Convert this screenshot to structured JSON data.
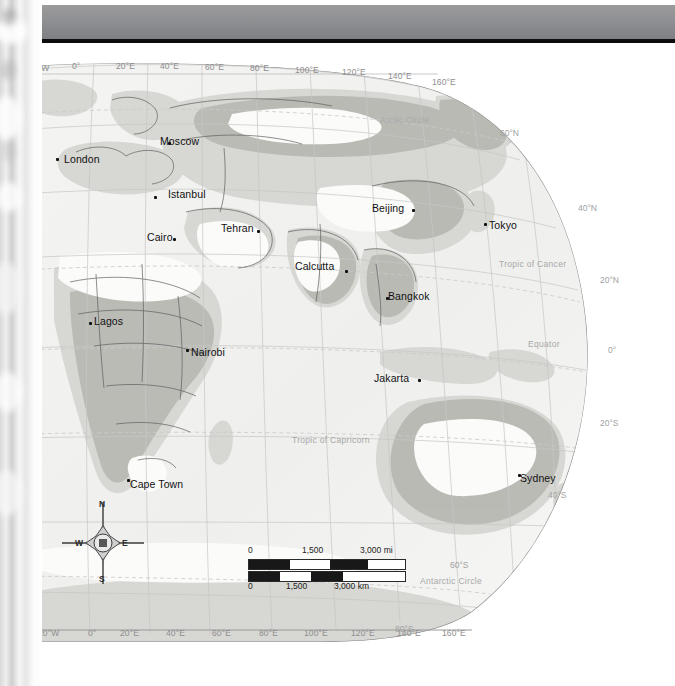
{
  "page": {
    "kind": "atlas-map-plate",
    "projection_note": "Eastern Hemisphere world map",
    "paper_color": "#f2f2f0",
    "header_band_color": "#8f9093",
    "ocean_color": "#ececeb",
    "land_color": "#d9d9d6",
    "land_dark_color": "#b8b8b4",
    "land_light_color": "#fbfbfa",
    "border_color": "#4a4a4a",
    "graticule_color": "#bdbdbd"
  },
  "graticule": {
    "top_longitude_labels": [
      "20°W",
      "0°",
      "20°E",
      "40°E",
      "60°E",
      "80°E",
      "100°E",
      "120°E",
      "140°E",
      "160°E"
    ],
    "bottom_longitude_labels": [
      "W",
      "20°W",
      "0°",
      "20°E",
      "40°E",
      "60°E",
      "80°E",
      "100°E",
      "120°E",
      "140°E",
      "160°E"
    ],
    "latitude_labels": [
      "60°N",
      "40°N",
      "20°N",
      "0°",
      "20°S",
      "40°S",
      "60°S",
      "80°S"
    ]
  },
  "reference_lines": [
    {
      "name": "Arctic Circle"
    },
    {
      "name": "Tropic of Cancer"
    },
    {
      "name": "Equator"
    },
    {
      "name": "Tropic of Capricorn"
    },
    {
      "name": "Antarctic Circle"
    }
  ],
  "cities": [
    {
      "name": "London",
      "x": 36,
      "y": 106,
      "dx": 8,
      "dy": 1
    },
    {
      "name": "Moscow",
      "x": 148,
      "y": 90,
      "dx": -8,
      "dy": -1
    },
    {
      "name": "Istanbul",
      "x": 134,
      "y": 144,
      "dx": 14,
      "dy": -2
    },
    {
      "name": "Cairo",
      "x": 153,
      "y": 186,
      "dx": -26,
      "dy": -1
    },
    {
      "name": "Tehran",
      "x": 237,
      "y": 178,
      "dx": -36,
      "dy": -2
    },
    {
      "name": "Beijing",
      "x": 392,
      "y": 157,
      "dx": -40,
      "dy": -1
    },
    {
      "name": "Tokyo",
      "x": 464,
      "y": 171,
      "dx": 5,
      "dy": 2
    },
    {
      "name": "Calcutta",
      "x": 325,
      "y": 218,
      "dx": -50,
      "dy": -4
    },
    {
      "name": "Bangkok",
      "x": 366,
      "y": 245,
      "dx": 2,
      "dy": -1
    },
    {
      "name": "Lagos",
      "x": 69,
      "y": 270,
      "dx": 5,
      "dy": -1
    },
    {
      "name": "Nairobi",
      "x": 166,
      "y": 297,
      "dx": 5,
      "dy": 3
    },
    {
      "name": "Jakarta",
      "x": 398,
      "y": 327,
      "dx": -44,
      "dy": -1
    },
    {
      "name": "Sydney",
      "x": 498,
      "y": 422,
      "dx": 2,
      "dy": 4
    },
    {
      "name": "Cape Town",
      "x": 107,
      "y": 427,
      "dx": 3,
      "dy": 5
    }
  ],
  "scalebar": {
    "miles": {
      "unit": "mi",
      "ticks": [
        "0",
        "1,500",
        "3,000 mi"
      ]
    },
    "kilometers": {
      "unit": "km",
      "ticks": [
        "0",
        "1,500",
        "3,000 km"
      ]
    }
  },
  "compass": {
    "north": "N",
    "south": "S",
    "east": "E",
    "west": "W"
  }
}
